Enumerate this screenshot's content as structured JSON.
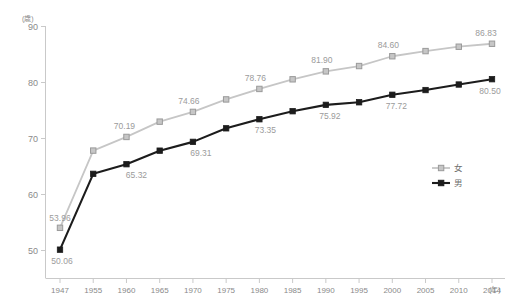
{
  "chart_data": {
    "type": "line",
    "title": "",
    "xlabel": "(年)",
    "ylabel": "(歳)",
    "ylim": [
      45,
      90
    ],
    "yticks": [
      50,
      60,
      70,
      80,
      90
    ],
    "grid": false,
    "legend_position": "right-middle",
    "categories": [
      "1947",
      "1955",
      "1960",
      "1965",
      "1970",
      "1975",
      "1980",
      "1985",
      "1990",
      "1995",
      "2000",
      "2005",
      "2010",
      "2014"
    ],
    "series": [
      {
        "name": "女",
        "color": "#c6c6c6",
        "marker": "square",
        "marker_fill": "#c6c6c6",
        "marker_stroke": "#9a9a9a",
        "values": [
          53.96,
          67.75,
          70.19,
          72.92,
          74.66,
          76.89,
          78.76,
          80.48,
          81.9,
          82.85,
          84.6,
          85.52,
          86.3,
          86.83
        ],
        "labels": [
          {
            "index": 0,
            "text": "53.96",
            "show": true
          },
          {
            "index": 2,
            "text": "70.19",
            "show": true
          },
          {
            "index": 4,
            "text": "74.66",
            "show": true
          },
          {
            "index": 6,
            "text": "78.76",
            "show": true
          },
          {
            "index": 8,
            "text": "81.90",
            "show": true
          },
          {
            "index": 10,
            "text": "84.60",
            "show": true
          },
          {
            "index": 13,
            "text": "86.83",
            "show": true
          }
        ]
      },
      {
        "name": "男",
        "color": "#1c1c1c",
        "marker": "square",
        "marker_fill": "#1c1c1c",
        "marker_stroke": "#1c1c1c",
        "values": [
          50.06,
          63.6,
          65.32,
          67.74,
          69.31,
          71.73,
          73.35,
          74.78,
          75.92,
          76.38,
          77.72,
          78.56,
          79.55,
          80.5
        ],
        "labels": [
          {
            "index": 0,
            "text": "50.06",
            "show": true
          },
          {
            "index": 2,
            "text": "65.32",
            "show": true
          },
          {
            "index": 4,
            "text": "69.31",
            "show": true
          },
          {
            "index": 6,
            "text": "73.35",
            "show": true
          },
          {
            "index": 8,
            "text": "75.92",
            "show": true
          },
          {
            "index": 10,
            "text": "77.72",
            "show": true
          },
          {
            "index": 13,
            "text": "80.50",
            "show": true
          }
        ]
      }
    ]
  },
  "axes": {
    "y_unit": "(歳)",
    "y_tick_labels": [
      "90",
      "80",
      "70",
      "60",
      "50"
    ],
    "x_tick_labels": [
      "1947",
      "1955",
      "1960",
      "1965",
      "1970",
      "1975",
      "1980",
      "1985",
      "1990",
      "1995",
      "2000",
      "2005",
      "2010",
      "2014"
    ],
    "x_unit": "(年)"
  },
  "legend": {
    "items": [
      {
        "label": "女",
        "color": "#c6c6c6"
      },
      {
        "label": "男",
        "color": "#1c1c1c"
      }
    ]
  }
}
